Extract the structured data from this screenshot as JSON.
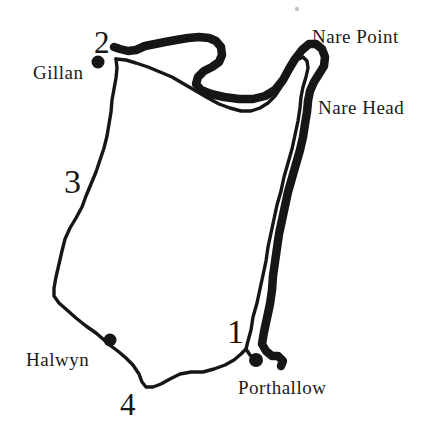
{
  "map": {
    "ink_color": "#161616",
    "background": "#ffffff",
    "place_labels": {
      "nare_point": "Nare Point",
      "nare_head": "Nare Head",
      "gillan": "Gillan",
      "halwyn": "Halwyn",
      "porthallow": "Porthallow"
    },
    "waypoint_numbers": {
      "stage1": "1",
      "stage2": "2",
      "stage3": "3",
      "stage4": "4"
    },
    "marker_dots": [
      "gillan",
      "halwyn",
      "porthallow"
    ]
  }
}
